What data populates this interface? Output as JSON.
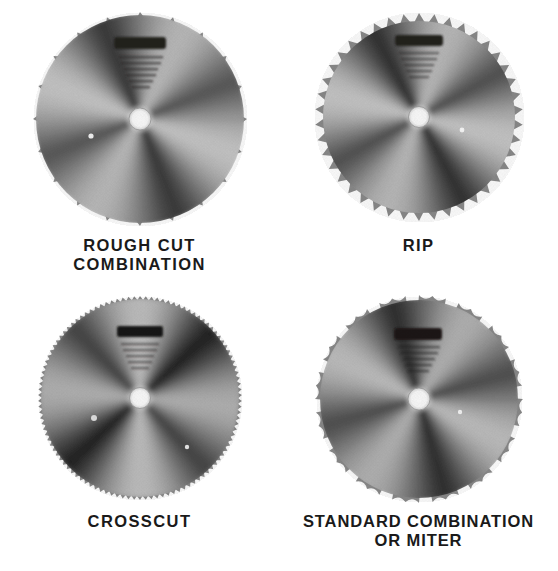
{
  "plate": {
    "kind": "saw-blade-type-plate",
    "background_color": "#ffffff",
    "ink_color": "#1a1a1a",
    "layout": "2x2 grid of circular saw blade photographs, each with a caption below",
    "medium": "black and white halftone print"
  },
  "blades": [
    {
      "id": "rough-cut-combination",
      "caption": "ROUGH CUT\nCOMBINATION",
      "caption_lines": [
        "ROUGH CUT",
        "COMBINATION"
      ],
      "tooth_count": 20,
      "tooth_style": "coarse pointed teeth with deep V gullets",
      "diameter_px": 200,
      "arbor_hole": "white center hole",
      "face_stamp": "dark illegible brand stamp near top of blade face",
      "face_text": "small illegible printed specification text below the stamp",
      "shading": "radial sunburst, alternating light and dark sectors"
    },
    {
      "id": "rip",
      "caption": "RIP",
      "caption_lines": [
        "RIP"
      ],
      "tooth_count": 42,
      "tooth_style": "fine uniform flat-top rip teeth",
      "diameter_px": 196,
      "arbor_hole": "white center hole",
      "face_stamp": "dark illegible brand stamp near top of blade face",
      "face_text": "small illegible printed specification text below the stamp",
      "shading": "radial sunburst, alternating light and dark sectors"
    },
    {
      "id": "crosscut",
      "caption": "CROSSCUT",
      "caption_lines": [
        "CROSSCUT"
      ],
      "tooth_count": 110,
      "tooth_style": "very fine crosscut teeth, nearly smooth rim",
      "diameter_px": 200,
      "arbor_hole": "white center hole",
      "face_stamp": "dark illegible brand stamp near top of blade face",
      "face_text": "small illegible printed specification text below the stamp",
      "shading": "radial sunburst with strong dark vertical band"
    },
    {
      "id": "standard-combination-or-miter",
      "caption": "STANDARD COMBINATION\nOR MITER",
      "caption_lines": [
        "STANDARD COMBINATION",
        "OR MITER"
      ],
      "tooth_count": 16,
      "tooth_style": "grouped teeth separated by deep rounded gullets",
      "diameter_px": 200,
      "arbor_hole": "white center hole",
      "face_stamp": "dark illegible brand stamp near top of blade face",
      "face_text": "small illegible printed specification text below the stamp",
      "shading": "radial sunburst, alternating light and dark sectors"
    }
  ]
}
